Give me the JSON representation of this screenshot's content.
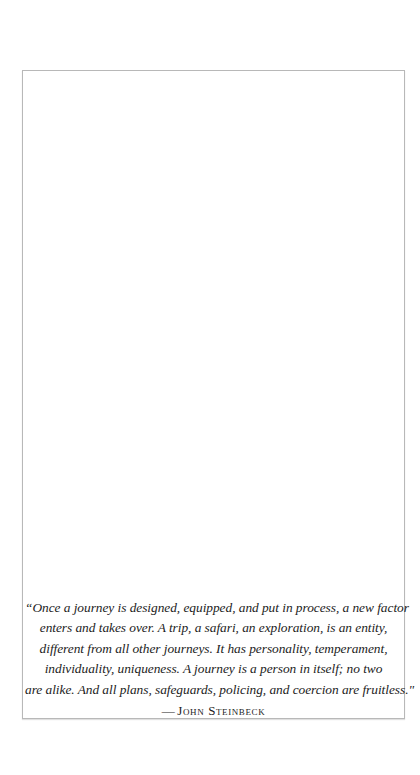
{
  "page": {
    "background": "#ffffff",
    "frame_border_color": "#b8b8b8"
  },
  "quote": {
    "lines": [
      "“Once a journey is designed, equipped, and put in process, a new factor",
      "enters and takes over. A trip, a safari, an exploration, is an entity,",
      "different from all other journeys. It has personality, temperament,",
      "individuality, uniqueness. A journey is a person in itself; no two",
      "are alike. And all plans, safeguards, policing, and coercion are fruitless.\""
    ],
    "attribution_dash": "—",
    "attribution": "John Steinbeck"
  }
}
